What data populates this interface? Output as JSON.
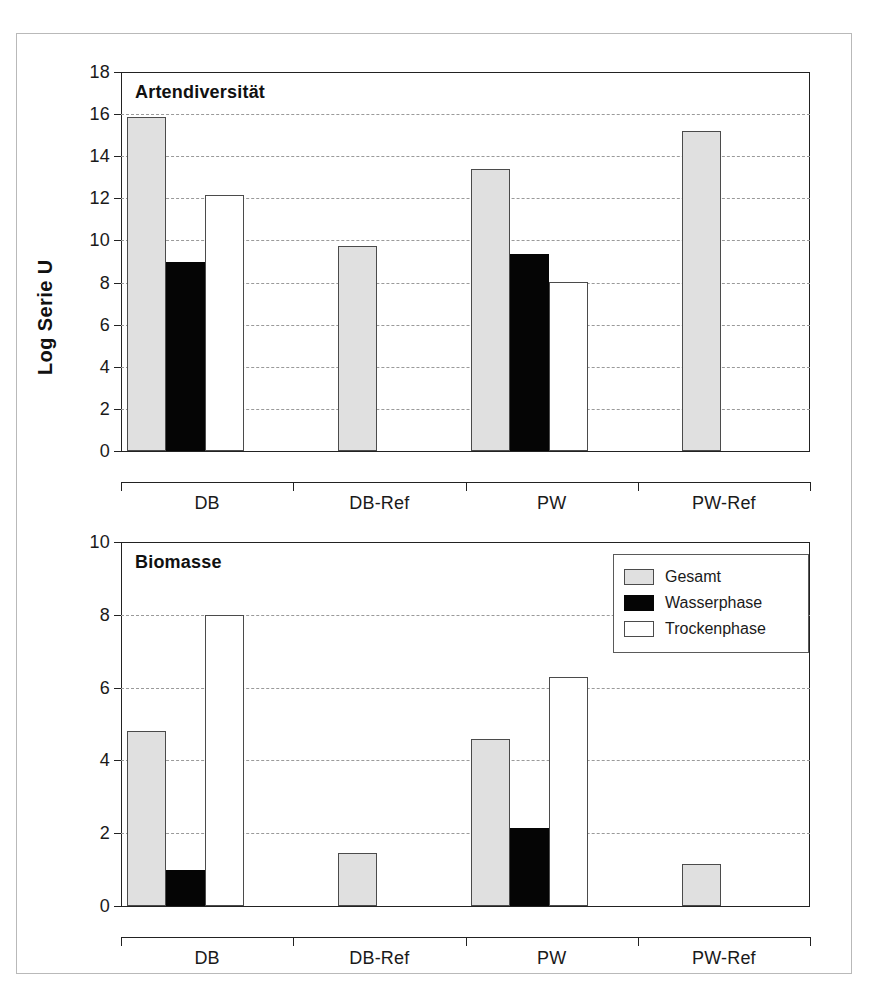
{
  "figure": {
    "background": "#ffffff",
    "frame_color": "#b9b9b9",
    "colors": {
      "gesamt": "#e0e0e0",
      "wasserphase": "#050505",
      "trockenphase": "#ffffff",
      "axis": "#222222",
      "grid": "#9a9a9a"
    }
  },
  "legend": {
    "position": "top-right of lower panel",
    "entries": [
      {
        "label": "Gesamt",
        "swatch": "gesamt"
      },
      {
        "label": "Wasserphase",
        "swatch": "wasser"
      },
      {
        "label": "Trockenphase",
        "swatch": "trocken"
      }
    ]
  },
  "chart_data": [
    {
      "id": "artendiversitaet",
      "type": "bar",
      "title": "Artendiversität",
      "xlabel": "",
      "ylabel": "Log Serie U",
      "ylim": [
        0,
        18
      ],
      "yticks": [
        0,
        2,
        4,
        6,
        8,
        10,
        12,
        14,
        16,
        18
      ],
      "ytick_labels": [
        "0",
        "2",
        "4",
        "6",
        "8",
        "10",
        "12",
        "14",
        "16",
        "18"
      ],
      "grid": true,
      "grid_axis": "y",
      "legend_position": "none",
      "categories": [
        "DB",
        "DB-Ref",
        "PW",
        "PW-Ref"
      ],
      "series": [
        {
          "name": "Gesamt",
          "values": [
            15.85,
            9.75,
            13.4,
            15.2
          ]
        },
        {
          "name": "Wasserphase",
          "values": [
            9.0,
            null,
            9.35,
            null
          ]
        },
        {
          "name": "Trockenphase",
          "values": [
            12.15,
            null,
            8.05,
            null
          ]
        }
      ]
    },
    {
      "id": "biomasse",
      "type": "bar",
      "title": "Biomasse",
      "xlabel": "",
      "ylabel": "AFTG [g/m²]",
      "ylim": [
        0,
        10
      ],
      "yticks": [
        0,
        2,
        4,
        6,
        8,
        10
      ],
      "ytick_labels": [
        "0",
        "2",
        "4",
        "6",
        "8",
        "10"
      ],
      "grid": true,
      "grid_axis": "y",
      "legend_position": "upper right",
      "categories": [
        "DB",
        "DB-Ref",
        "PW",
        "PW-Ref"
      ],
      "series": [
        {
          "name": "Gesamt",
          "values": [
            4.8,
            1.45,
            4.6,
            1.15
          ]
        },
        {
          "name": "Wasserphase",
          "values": [
            1.0,
            null,
            2.15,
            null
          ]
        },
        {
          "name": "Trockenphase",
          "values": [
            8.0,
            null,
            6.3,
            null
          ]
        }
      ]
    }
  ]
}
